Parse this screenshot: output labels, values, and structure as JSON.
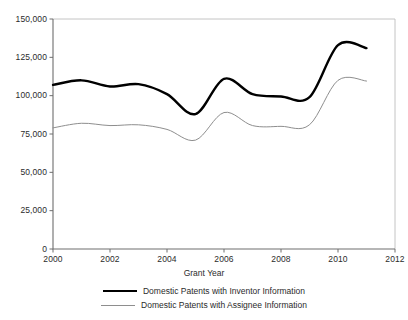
{
  "chart_data": {
    "type": "line",
    "title": "",
    "xlabel": "Grant Year",
    "ylabel": "",
    "xlim": [
      2000,
      2012
    ],
    "ylim": [
      0,
      150000
    ],
    "grid": false,
    "legend_position": "bottom",
    "xticks": [
      2000,
      2002,
      2004,
      2006,
      2008,
      2010,
      2012
    ],
    "xtick_labels": [
      "2000",
      "2002",
      "2004",
      "2006",
      "2008",
      "2010",
      "2012"
    ],
    "yticks": [
      0,
      25000,
      50000,
      75000,
      100000,
      125000,
      150000
    ],
    "ytick_labels": [
      "0",
      "25,000",
      "50,000",
      "75,000",
      "100,000",
      "125,000",
      "150,000"
    ],
    "x": [
      2000,
      2001,
      2002,
      2003,
      2004,
      2005,
      2006,
      2007,
      2008,
      2009,
      2010,
      2011
    ],
    "series": [
      {
        "name": "Domestic Patents with Inventor Information",
        "color": "#000000",
        "width": 2.4,
        "values": [
          107000,
          110000,
          106000,
          107500,
          101000,
          88000,
          111000,
          101000,
          99500,
          99000,
          133000,
          131000
        ]
      },
      {
        "name": "Domestic Patents with Assignee Information",
        "color": "#8e8e8e",
        "width": 1.0,
        "values": [
          79000,
          82000,
          80500,
          81000,
          78000,
          71000,
          89000,
          80500,
          80000,
          81000,
          110000,
          109500
        ]
      }
    ]
  },
  "axes": {
    "plot_left": 53,
    "plot_right": 395,
    "plot_top": 19,
    "plot_bottom": 249,
    "axis_color": "#6e6e6e"
  },
  "legend": {
    "items": [
      {
        "label": "Domestic Patents with Inventor Information",
        "style": "thick"
      },
      {
        "label": "Domestic Patents with Assignee Information",
        "style": "thin"
      }
    ]
  }
}
